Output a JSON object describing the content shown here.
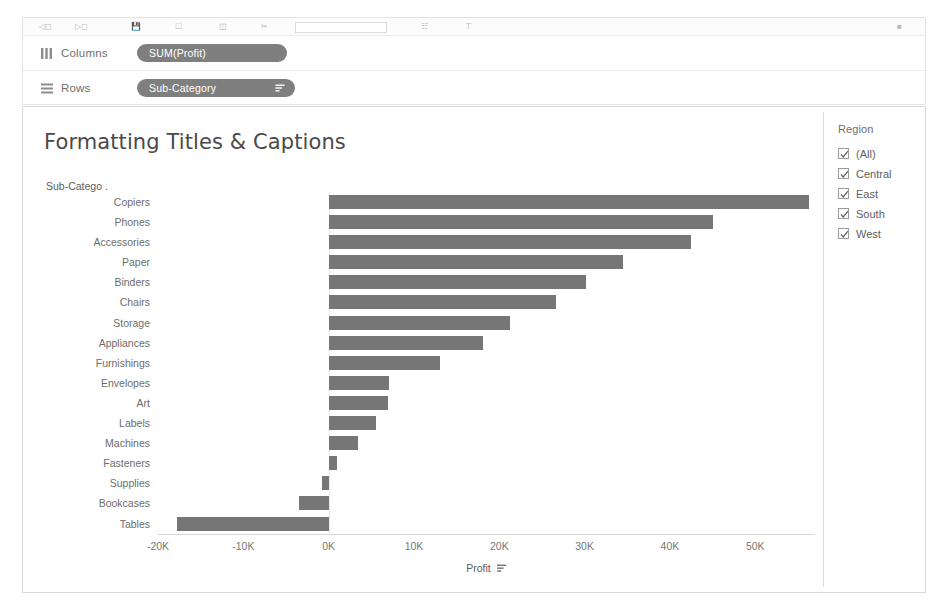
{
  "toolbar": {
    "icons": [
      "undo-icon",
      "redo-icon",
      "save-icon",
      "new-sheet-icon",
      "duplicate-icon",
      "clear-icon",
      "swap-icon",
      "sort-asc-icon",
      "sort-desc-icon",
      "highlight-icon",
      "presentation-icon"
    ]
  },
  "shelves": {
    "columns": {
      "label": "Columns",
      "icon": "columns-icon",
      "pill": "SUM(Profit)"
    },
    "rows": {
      "label": "Rows",
      "icon": "rows-icon",
      "pill": "Sub-Category",
      "pill_sort_icon": "sort-descending-icon"
    }
  },
  "viz": {
    "title": "Formatting Titles & Captions",
    "row_field_header": "Sub-Catego ."
  },
  "filter": {
    "title": "Region",
    "items": [
      {
        "label": "(All)",
        "checked": true
      },
      {
        "label": "Central",
        "checked": true
      },
      {
        "label": "East",
        "checked": true
      },
      {
        "label": "South",
        "checked": true
      },
      {
        "label": "West",
        "checked": true
      }
    ]
  },
  "chart_data": {
    "type": "bar",
    "orientation": "horizontal",
    "title": "Formatting Titles & Captions",
    "xlabel": "Profit",
    "ylabel": "Sub-Category",
    "xlim": [
      -20000,
      57000
    ],
    "axis_ticks": [
      -20000,
      -10000,
      0,
      10000,
      20000,
      30000,
      40000,
      50000
    ],
    "axis_tick_labels": [
      "-20K",
      "-10K",
      "0K",
      "10K",
      "20K",
      "30K",
      "40K",
      "50K"
    ],
    "grid": false,
    "legend": "none",
    "sorted": "descending",
    "bar_color": "#767676",
    "categories": [
      "Copiers",
      "Phones",
      "Accessories",
      "Paper",
      "Binders",
      "Chairs",
      "Storage",
      "Appliances",
      "Furnishings",
      "Envelopes",
      "Art",
      "Labels",
      "Machines",
      "Fasteners",
      "Supplies",
      "Bookcases",
      "Tables"
    ],
    "values": [
      56300,
      45100,
      42500,
      34500,
      30200,
      26600,
      21300,
      18100,
      13100,
      7100,
      6900,
      5500,
      3400,
      1000,
      -800,
      -3500,
      -17800
    ],
    "series": [
      {
        "name": "SUM(Profit)",
        "values": [
          56300,
          45100,
          42500,
          34500,
          30200,
          26600,
          21300,
          18100,
          13100,
          7100,
          6900,
          5500,
          3400,
          1000,
          -800,
          -3500,
          -17800
        ]
      }
    ]
  }
}
